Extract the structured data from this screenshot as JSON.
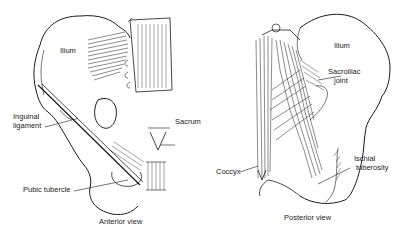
{
  "figure": {
    "panels": [
      {
        "id": "anterior",
        "caption": "Anterior view",
        "labels": {
          "ilium": "Ilium",
          "inguinal_1": "Inguinal",
          "inguinal_2": "ligament",
          "sacrum": "Sacrum",
          "pubic_tubercle": "Pubic tubercle"
        }
      },
      {
        "id": "posterior",
        "caption": "Posterior view",
        "labels": {
          "ilium": "Ilium",
          "sacroiliac_1": "Sacroiliac",
          "sacroiliac_2": "joint",
          "coccyx": "Coccyx",
          "ischial_1": "Ischial",
          "ischial_2": "tuberosity"
        }
      }
    ]
  }
}
